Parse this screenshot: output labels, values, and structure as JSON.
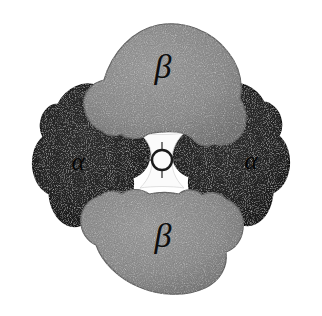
{
  "figure": {
    "background_color": "#ffffff",
    "canvas": {
      "width": 322,
      "height": 316
    }
  },
  "subunits": [
    {
      "id": "beta-top",
      "label": "β",
      "chain": "beta",
      "fill_color": "#8b8b8b",
      "edge_color": "#6e6e6e",
      "label_position": {
        "x": 163,
        "y": 70
      },
      "depth": "front"
    },
    {
      "id": "alpha-left",
      "label": "α",
      "chain": "alpha",
      "fill_color": "#232323",
      "edge_color": "#111111",
      "label_position": {
        "x": 78,
        "y": 164
      },
      "depth": "back"
    },
    {
      "id": "alpha-right",
      "label": "α",
      "chain": "alpha",
      "fill_color": "#232323",
      "edge_color": "#111111",
      "label_position": {
        "x": 251,
        "y": 163
      },
      "depth": "back"
    },
    {
      "id": "beta-bottom",
      "label": "β",
      "chain": "beta",
      "fill_color": "#8b8b8b",
      "edge_color": "#6e6e6e",
      "label_position": {
        "x": 163,
        "y": 239
      },
      "depth": "front"
    }
  ],
  "central_axis": {
    "name": "twofold-symmetry-axis",
    "symbol": "ring-with-ticks",
    "center": {
      "x": 162,
      "y": 160
    },
    "ring_radius": 10,
    "ring_color": "#1a1a1a",
    "cavity_color": "#fbfbfb",
    "tick_count": 4
  },
  "colors": {
    "beta_gray": "#8b8b8b",
    "alpha_dark": "#232323",
    "cavity_white": "#fbfbfb",
    "label_black": "#0d0d0d",
    "background": "#ffffff"
  }
}
